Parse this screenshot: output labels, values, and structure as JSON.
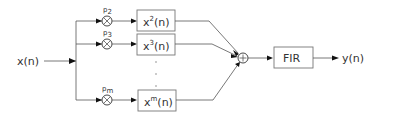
{
  "diagram": {
    "input_label": "x(n)",
    "output_label": "y(n)",
    "filter_label": "FIR",
    "sum_symbol": "+",
    "multiplier_symbol": "⊗",
    "branches": [
      {
        "coef_base": "p",
        "coef_sub": "2",
        "block_base": "x",
        "block_sup": "2",
        "block_tail": "(n)"
      },
      {
        "coef_base": "p",
        "coef_sub": "3",
        "block_base": "x",
        "block_sup": "3",
        "block_tail": "(n)"
      },
      {
        "coef_base": "p",
        "coef_sub": "m",
        "block_base": "x",
        "block_sup": "m",
        "block_tail": "(n)"
      }
    ],
    "ellipsis": [
      "·",
      "·",
      "·"
    ]
  }
}
